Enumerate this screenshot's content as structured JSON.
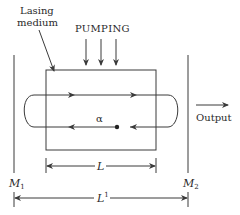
{
  "diagram": {
    "labels": {
      "medium_line1": "Lasing",
      "medium_line2": "medium",
      "pumping": "PUMPING",
      "output": "Output",
      "alpha": "α",
      "L": "L",
      "L_prime": "L",
      "L_prime_sup": "1",
      "M1": "M",
      "M1_sub": "1",
      "M2": "M",
      "M2_sub": "2"
    },
    "colors": {
      "line": "#3a3a3a",
      "text": "#2a2a2a",
      "background": "#ffffff"
    }
  }
}
